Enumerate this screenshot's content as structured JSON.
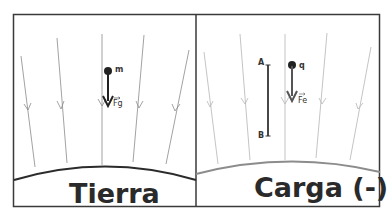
{
  "panels": [
    {
      "id": "earth",
      "title": "Tierra",
      "particle_label": "m",
      "force_label": "Fg",
      "field_line_color": "#8a8a8a",
      "surface_color": "#2b2b2b"
    },
    {
      "id": "charge",
      "title": "Carga (-)",
      "particle_label": "q",
      "force_label": "Fe",
      "segment_start_label": "A",
      "segment_end_label": "B",
      "field_line_color": "#b5b5b5",
      "surface_color": "#8c8c8c"
    }
  ],
  "colors": {
    "border": "#3a3a3a",
    "arrow": "#2b2b2b",
    "arrow_charge": "#4a4a4a"
  }
}
